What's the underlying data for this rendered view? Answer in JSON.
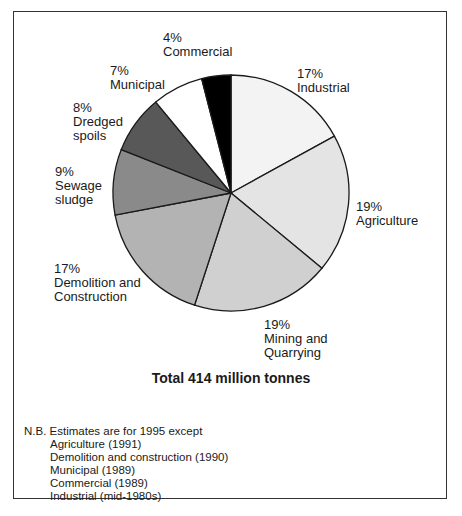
{
  "chart_data": {
    "type": "pie",
    "title": "Total 414 million tonnes",
    "total_million_tonnes": 414,
    "start": "12 o'clock, clockwise",
    "slices": [
      {
        "name": "Industrial",
        "value": 17,
        "label": "17%\nIndustrial",
        "color": "#f3f3f3"
      },
      {
        "name": "Agriculture",
        "value": 19,
        "label": "19%\nAgriculture",
        "color": "#e4e4e4"
      },
      {
        "name": "Mining and Quarrying",
        "value": 19,
        "label": "19%\nMining and\nQuarrying",
        "color": "#d0d0d0"
      },
      {
        "name": "Demolition and Construction",
        "value": 17,
        "label": "17%\nDemolition and\nConstruction",
        "color": "#b3b3b3"
      },
      {
        "name": "Sewage sludge",
        "value": 9,
        "label": "9%\nSewage\nsludge",
        "color": "#8a8a8a"
      },
      {
        "name": "Dredged spoils",
        "value": 8,
        "label": "8%\nDredged\nspoils",
        "color": "#585858"
      },
      {
        "name": "Municipal",
        "value": 7,
        "label": "7%\nMunicipal",
        "color": "#ffffff"
      },
      {
        "name": "Commercial",
        "value": 4,
        "label": "4%\nCommercial",
        "color": "#000000"
      }
    ]
  },
  "labels": {
    "industrial": "17%\nIndustrial",
    "agriculture": "19%\nAgriculture",
    "mining": "19%\nMining and\nQuarrying",
    "demolition": "17%\nDemolition and\nConstruction",
    "sewage": "9%\nSewage\nsludge",
    "dredged": "8%\nDredged\nspoils",
    "municipal": "7%\nMunicipal",
    "commercial": "4%\nCommercial"
  },
  "total_label": "Total 414 million tonnes",
  "note": {
    "heading": "N.B. Estimates are for 1995 except",
    "items": [
      "Agriculture (1991)",
      "Demolition and construction (1990)",
      "Municipal (1989)",
      "Commercial (1989)",
      "Industrial (mid-1980s)"
    ]
  }
}
